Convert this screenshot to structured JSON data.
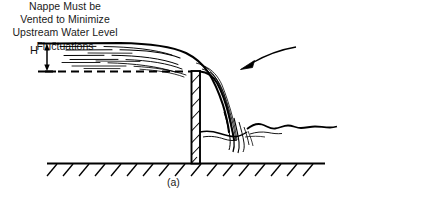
{
  "figure": {
    "caption": "(a)",
    "dimension_label": "H",
    "annotation_lines": [
      "Nappe Must be",
      "Vented to Minimize",
      "Upstream Water Level",
      "Fluctuations"
    ],
    "colors": {
      "ink": "#000000",
      "text": "#1a1a1a",
      "background": "#ffffff"
    },
    "elements": {
      "upstream_water_surface": "solid line",
      "crest_level_line": "dashed line",
      "weir_plate": "hatched vertical plate",
      "nappe": "free falling jet curve",
      "ground": "hatched ground line",
      "downstream_pool": "wavy water surface",
      "leader_arrow": "arrow pointing to nappe"
    }
  }
}
